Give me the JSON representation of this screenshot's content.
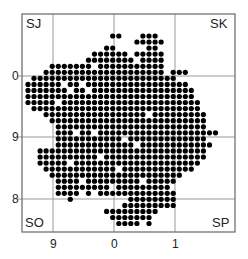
{
  "map": {
    "frame": {
      "left": 22,
      "top": 14,
      "right": 235,
      "bottom": 232
    },
    "grid_lines": {
      "vertical_x": [
        53,
        114,
        175
      ],
      "horizontal_y": [
        76,
        137,
        199
      ],
      "color": "#999999"
    },
    "grid_squares": {
      "top_left": "SJ",
      "top_right": "SK",
      "bottom_left": "SO",
      "bottom_right": "SP"
    },
    "y_axis_labels": [
      {
        "text": "0",
        "y": 76
      },
      {
        "text": "9",
        "y": 137
      },
      {
        "text": "8",
        "y": 199
      }
    ],
    "x_axis_labels": [
      {
        "text": "9",
        "x": 53
      },
      {
        "text": "0",
        "x": 114
      },
      {
        "text": "1",
        "x": 175
      }
    ],
    "dot_color": "#000000",
    "dot_grid": {
      "x0": 28,
      "y0": 36,
      "pitch": 6.05,
      "radius": 2.6
    },
    "dot_rows": [
      {
        "r": 0,
        "segs": [
          [
            14,
            15
          ],
          [
            19,
            21
          ]
        ]
      },
      {
        "r": 1,
        "segs": [
          [
            18,
            22
          ]
        ]
      },
      {
        "r": 2,
        "segs": [
          [
            20,
            21
          ],
          [
            13,
            14
          ]
        ]
      },
      {
        "r": 3,
        "segs": [
          [
            11,
            16
          ],
          [
            18,
            22
          ]
        ]
      },
      {
        "r": 4,
        "segs": [
          [
            10,
            17
          ],
          [
            19,
            22
          ]
        ]
      },
      {
        "r": 5,
        "segs": [
          [
            4,
            10
          ],
          [
            12,
            22
          ]
        ]
      },
      {
        "r": 6,
        "segs": [
          [
            3,
            11
          ],
          [
            12,
            22
          ],
          [
            24,
            26
          ]
        ]
      },
      {
        "r": 7,
        "segs": [
          [
            1,
            24
          ]
        ]
      },
      {
        "r": 8,
        "segs": [
          [
            0,
            8
          ],
          [
            10,
            26
          ]
        ]
      },
      {
        "r": 9,
        "segs": [
          [
            0,
            6
          ],
          [
            8,
            27
          ]
        ]
      },
      {
        "r": 10,
        "segs": [
          [
            0,
            27
          ]
        ]
      },
      {
        "r": 11,
        "segs": [
          [
            0,
            4
          ],
          [
            6,
            28
          ]
        ]
      },
      {
        "r": 12,
        "segs": [
          [
            1,
            28
          ]
        ]
      },
      {
        "r": 13,
        "segs": [
          [
            3,
            29
          ]
        ]
      },
      {
        "r": 14,
        "segs": [
          [
            4,
            29
          ]
        ]
      },
      {
        "r": 15,
        "segs": [
          [
            5,
            29
          ]
        ]
      },
      {
        "r": 16,
        "segs": [
          [
            5,
            10
          ],
          [
            12,
            31
          ]
        ]
      },
      {
        "r": 17,
        "segs": [
          [
            5,
            29
          ]
        ]
      },
      {
        "r": 18,
        "segs": [
          [
            5,
            30
          ]
        ]
      },
      {
        "r": 19,
        "segs": [
          [
            2,
            29
          ]
        ]
      },
      {
        "r": 20,
        "segs": [
          [
            2,
            29
          ]
        ]
      },
      {
        "r": 21,
        "segs": [
          [
            2,
            28
          ]
        ]
      },
      {
        "r": 22,
        "segs": [
          [
            3,
            27
          ]
        ]
      },
      {
        "r": 23,
        "segs": [
          [
            4,
            25
          ]
        ]
      },
      {
        "r": 24,
        "segs": [
          [
            5,
            24
          ]
        ]
      },
      {
        "r": 25,
        "segs": [
          [
            5,
            23
          ]
        ]
      },
      {
        "r": 26,
        "segs": [
          [
            5,
            8
          ],
          [
            10,
            10
          ],
          [
            12,
            24
          ]
        ]
      },
      {
        "r": 27,
        "segs": [
          [
            7,
            7
          ],
          [
            17,
            24
          ]
        ]
      },
      {
        "r": 28,
        "segs": [
          [
            16,
            24
          ]
        ]
      },
      {
        "r": 29,
        "segs": [
          [
            13,
            21
          ]
        ]
      },
      {
        "r": 30,
        "segs": [
          [
            14,
            20
          ]
        ]
      },
      {
        "r": 31,
        "segs": [
          [
            15,
            18
          ],
          [
            20,
            20
          ]
        ]
      }
    ],
    "holes": [
      [
        5,
        3
      ],
      [
        8,
        6
      ],
      [
        9,
        10
      ],
      [
        11,
        5
      ],
      [
        13,
        20
      ],
      [
        16,
        8
      ],
      [
        17,
        16
      ],
      [
        18,
        18
      ],
      [
        20,
        12
      ],
      [
        21,
        7
      ],
      [
        22,
        15
      ],
      [
        24,
        9
      ],
      [
        24,
        19
      ],
      [
        25,
        14
      ],
      [
        26,
        11
      ]
    ]
  }
}
